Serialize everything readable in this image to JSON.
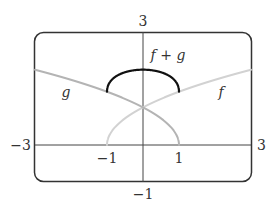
{
  "chart_data": {
    "type": "line",
    "title": "",
    "xlabel": "",
    "ylabel": "",
    "xlim": [
      -3,
      3
    ],
    "ylim": [
      -1,
      3
    ],
    "grid": false,
    "legend": "inline labels",
    "tick_labels": {
      "x_left": "−3",
      "x_right": "3",
      "y_top": "3",
      "y_bottom": "−1",
      "x_marks": [
        "−1",
        "1"
      ]
    },
    "series": [
      {
        "name": "f",
        "label": "f",
        "formula": "sqrt(x + 1)",
        "domain": [
          -1,
          3
        ],
        "color": "#d2d2d2",
        "x": [
          -1,
          -0.75,
          -0.5,
          0,
          0.5,
          1,
          1.5,
          2,
          2.5,
          3
        ],
        "values": [
          0,
          0.5,
          0.71,
          1,
          1.22,
          1.41,
          1.58,
          1.73,
          1.87,
          2
        ]
      },
      {
        "name": "g",
        "label": "g",
        "formula": "sqrt(1 - x)",
        "domain": [
          -3,
          1
        ],
        "color": "#b4b4b4",
        "x": [
          -3,
          -2.5,
          -2,
          -1.5,
          -1,
          -0.5,
          0,
          0.5,
          0.75,
          1
        ],
        "values": [
          2,
          1.87,
          1.73,
          1.58,
          1.41,
          1.22,
          1,
          0.71,
          0.5,
          0
        ]
      },
      {
        "name": "f + g",
        "label": "f + g",
        "formula": "sqrt(x + 1) + sqrt(1 - x)",
        "domain": [
          -1,
          1
        ],
        "color": "#111111",
        "x": [
          -1,
          -0.75,
          -0.5,
          -0.25,
          0,
          0.25,
          0.5,
          0.75,
          1
        ],
        "values": [
          1.41,
          1.82,
          1.93,
          1.98,
          2,
          1.98,
          1.93,
          1.82,
          1.41
        ]
      }
    ]
  }
}
